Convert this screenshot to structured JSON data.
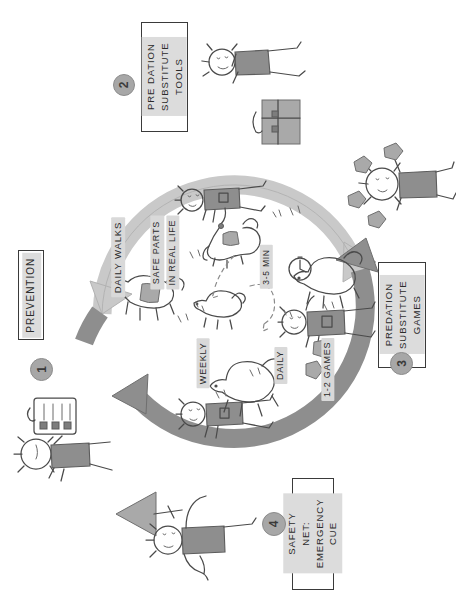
{
  "diagram": {
    "orientation": "rotated-90",
    "steps": [
      {
        "number": "1",
        "label": "PREVENTION"
      },
      {
        "number": "2",
        "label": "PREDATION SUBSTITUTE TOOLS"
      },
      {
        "number": "3",
        "label": "PREDATION SUBSTITUTE GAMES"
      },
      {
        "number": "4",
        "label": "SAFETY NET: EMERGENCY CUE"
      }
    ],
    "step_text": {
      "s1_line1": "PREVENTION",
      "s2_line1": "PRE DATION",
      "s2_line2": "SUBSTITUTE",
      "s2_line3": "TOOLS",
      "s3_line1": "PREDATION",
      "s3_line2": "SUBSTITUTE",
      "s3_line3": "GAMES",
      "s4_line1": "SAFETY NET:",
      "s4_line2": "EMERGENCY CUE"
    },
    "inner_labels": [
      {
        "id": "daily-walks",
        "text": "DAILY WALKS"
      },
      {
        "id": "safe-parts-line1",
        "text": "SAFE PARTS"
      },
      {
        "id": "safe-parts-line2",
        "text": "IN REAL LIFE"
      },
      {
        "id": "duration",
        "text": "3-5 MIN"
      },
      {
        "id": "frequency-daily",
        "text": "DAILY"
      },
      {
        "id": "games-count",
        "text": "1-2 GAMES"
      },
      {
        "id": "frequency-weekly",
        "text": "WEEKLY"
      }
    ],
    "colors": {
      "ink": "#4a4a4a",
      "arrow_light": "#c9c9c9",
      "arrow_dark": "#8e8e8e",
      "highlight": "#d9d9d9",
      "paper": "#ffffff"
    },
    "icons": [
      {
        "id": "person-checklist-icon",
        "description": "person holding checklist"
      },
      {
        "id": "person-toolbag-icon",
        "description": "person with tool bag"
      },
      {
        "id": "person-treats-icon",
        "description": "person scattering treats"
      },
      {
        "id": "person-arrow-icon",
        "description": "person with emergency recall arrow"
      },
      {
        "id": "person-dog-leash-icon",
        "description": "person walking dog on leash"
      },
      {
        "id": "dog-running-icon",
        "description": "running dog"
      },
      {
        "id": "clock-icon",
        "description": "stopwatch clock"
      }
    ]
  }
}
